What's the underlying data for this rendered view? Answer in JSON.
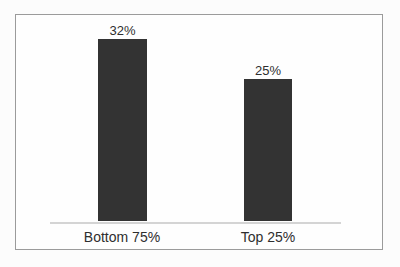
{
  "chart_data": {
    "type": "bar",
    "categories": [
      "Bottom 75%",
      "Top 25%"
    ],
    "values": [
      32,
      25
    ],
    "value_labels": [
      "32%",
      "25%"
    ],
    "title": "",
    "xlabel": "",
    "ylabel": "",
    "ylim": [
      0,
      36
    ],
    "grid": false,
    "legend_position": "none",
    "bar_color": "#333333",
    "baseline_color": "#d4d4d4",
    "frame_border_color": "#9b9b9b",
    "text_color": "#2e2e2e"
  }
}
